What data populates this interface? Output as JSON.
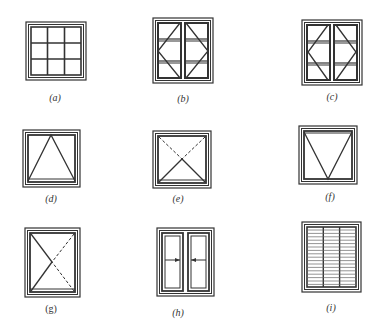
{
  "figure": {
    "line_color": "#333333",
    "panels": [
      {
        "id": "a",
        "label": "(a)",
        "type": "fixed-grid-3x3"
      },
      {
        "id": "b",
        "label": "(b)",
        "type": "double-casement-side-hung-outward"
      },
      {
        "id": "c",
        "label": "(c)",
        "type": "double-casement-side-hung-outward-alt"
      },
      {
        "id": "d",
        "label": "(d)",
        "type": "top-hung"
      },
      {
        "id": "e",
        "label": "(e)",
        "type": "top-hung-inward-dashed"
      },
      {
        "id": "f",
        "label": "(f)",
        "type": "bottom-hung"
      },
      {
        "id": "g",
        "label": "(g)",
        "type": "tilt-turn"
      },
      {
        "id": "h",
        "label": "(h)",
        "type": "sliding-double"
      },
      {
        "id": "i",
        "label": "(i)",
        "type": "louvre"
      }
    ]
  }
}
